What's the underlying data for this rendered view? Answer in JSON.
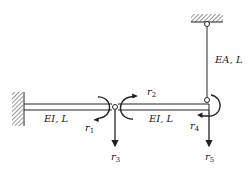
{
  "figure": {
    "members": [
      {
        "id": "beam-1",
        "label": "EI, L"
      },
      {
        "id": "beam-2",
        "label": "EI, L"
      },
      {
        "id": "rod",
        "label": "EA, L"
      }
    ],
    "dofs": [
      {
        "id": "r1",
        "symbol": "r",
        "index": "1"
      },
      {
        "id": "r2",
        "symbol": "r",
        "index": "2"
      },
      {
        "id": "r3",
        "symbol": "r",
        "index": "3"
      },
      {
        "id": "r4",
        "symbol": "r",
        "index": "4"
      },
      {
        "id": "r5",
        "symbol": "r",
        "index": "5"
      }
    ],
    "colors": {
      "line": "#222222",
      "background": "#ffffff"
    }
  }
}
